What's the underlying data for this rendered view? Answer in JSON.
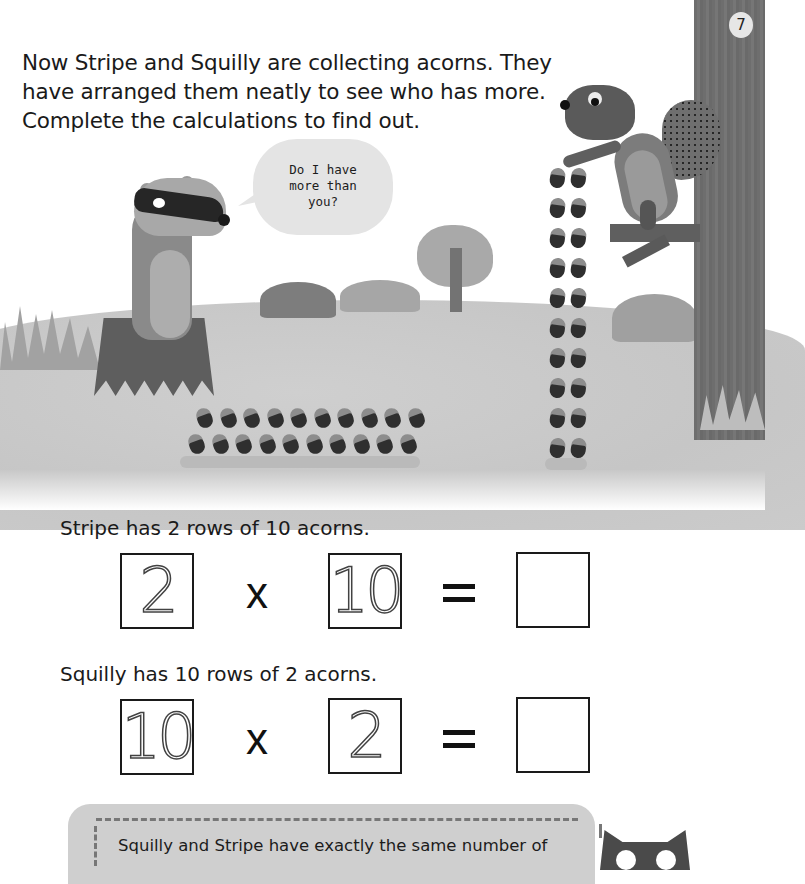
{
  "page": {
    "page_number": "7",
    "intro_lines": [
      "Now Stripe and Squilly are collecting acorns. They",
      "have arranged them neatly to see who has more.",
      "Complete the calculations to find out."
    ]
  },
  "illustration": {
    "speech_bubble": {
      "speaker": "Stripe (badger)",
      "lines": [
        "Do I have",
        "more than",
        "you?"
      ]
    },
    "characters": [
      "Stripe the badger",
      "Squilly the squirrel"
    ],
    "stripe_acorns": {
      "rows": 2,
      "per_row": 10
    },
    "squilly_acorns": {
      "rows": 10,
      "per_row": 2
    }
  },
  "exercises": [
    {
      "sentence": "Stripe has 2 rows of 10 acorns.",
      "factor_a": "2",
      "operator": "x",
      "factor_b": "10",
      "equals": "=",
      "answer": ""
    },
    {
      "sentence": "Squilly has 10 rows of 2 acorns.",
      "factor_a": "10",
      "operator": "x",
      "factor_b": "2",
      "equals": "=",
      "answer": ""
    }
  ],
  "note": {
    "text": "Squilly and Stripe have exactly the same number of"
  }
}
